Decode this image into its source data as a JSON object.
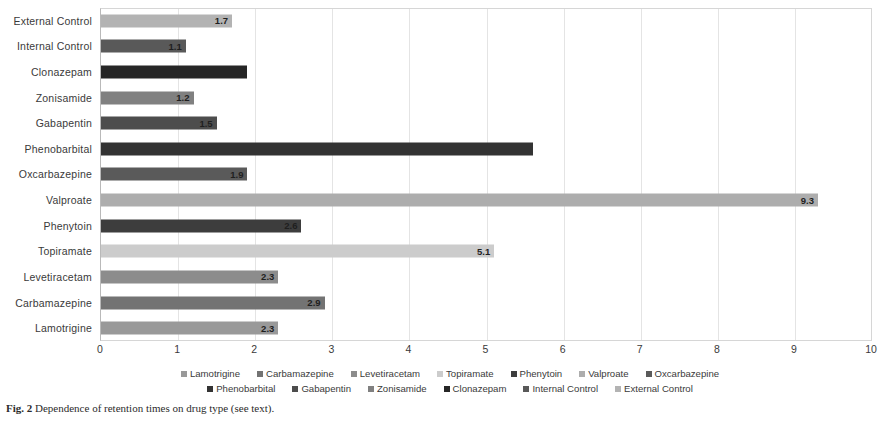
{
  "chart_data": {
    "type": "bar",
    "orientation": "horizontal",
    "title": "",
    "xlabel": "",
    "ylabel": "",
    "xlim": [
      0,
      10
    ],
    "xticks": [
      "0",
      "1",
      "2",
      "3",
      "4",
      "5",
      "6",
      "7",
      "8",
      "9",
      "10"
    ],
    "grid": true,
    "legend_position": "bottom",
    "categories": [
      "External Control",
      "Internal Control",
      "Clonazepam",
      "Zonisamide",
      "Gabapentin",
      "Phenobarbital",
      "Oxcarbazepine",
      "Valproate",
      "Phenytoin",
      "Topiramate",
      "Levetiracetam",
      "Carbamazepine",
      "Lamotrigine"
    ],
    "values": [
      1.7,
      1.1,
      1.9,
      1.2,
      1.5,
      5.6,
      1.9,
      9.3,
      2.6,
      5.1,
      2.3,
      2.9,
      2.3
    ],
    "value_labels": [
      "1.7",
      "1.1",
      "",
      "1.2",
      "1.5",
      "",
      "1.9",
      "9.3",
      "2.6",
      "5.1",
      "2.3",
      "2.9",
      "2.3"
    ],
    "bar_colors": [
      "#b3b3b3",
      "#595959",
      "#262626",
      "#808080",
      "#4d4d4d",
      "#333333",
      "#5a5a5a",
      "#adadad",
      "#3d3d3d",
      "#cccccc",
      "#8c8c8c",
      "#737373",
      "#999999"
    ]
  },
  "legend": {
    "row1": [
      {
        "label": "Lamotrigine",
        "color": "#999999"
      },
      {
        "label": "Carbamazepine",
        "color": "#737373"
      },
      {
        "label": "Levetiracetam",
        "color": "#8c8c8c"
      },
      {
        "label": "Topiramate",
        "color": "#cccccc"
      },
      {
        "label": "Phenytoin",
        "color": "#3d3d3d"
      },
      {
        "label": "Valproate",
        "color": "#adadad"
      },
      {
        "label": "Oxcarbazepine",
        "color": "#5a5a5a"
      }
    ],
    "row2": [
      {
        "label": "Phenobarbital",
        "color": "#333333"
      },
      {
        "label": "Gabapentin",
        "color": "#4d4d4d"
      },
      {
        "label": "Zonisamide",
        "color": "#808080"
      },
      {
        "label": "Clonazepam",
        "color": "#262626"
      },
      {
        "label": "Internal Control",
        "color": "#595959"
      },
      {
        "label": "External Control",
        "color": "#b3b3b3"
      }
    ]
  },
  "caption": {
    "prefix": "Fig. 2",
    "text": "  Dependence of retention times on drug type (see text)."
  }
}
